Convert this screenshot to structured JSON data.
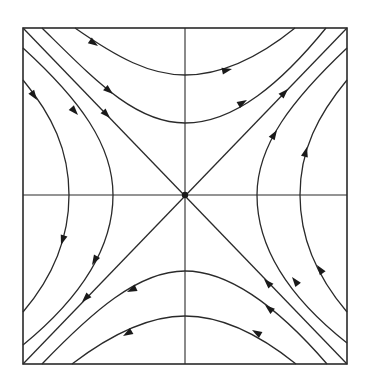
{
  "diagram": {
    "type": "phase-portrait",
    "kind": "saddle-point",
    "colors": {
      "ink": "#2a2a2a",
      "background": "#ffffff"
    },
    "frame": {
      "x0": 23,
      "y0": 28,
      "x1": 347,
      "y1": 364
    },
    "origin": {
      "x": 185,
      "y": 195
    },
    "separatrices": [
      {
        "name": "stable-diagonal",
        "from": [
          23,
          28
        ],
        "to": [
          347,
          364
        ],
        "flow": "inward"
      },
      {
        "name": "unstable-diagonal",
        "from": [
          347,
          28
        ],
        "to": [
          23,
          364
        ],
        "flow": "outward"
      }
    ],
    "trajectories": {
      "top": [
        {
          "left": [
            75,
            28
          ],
          "vertex": [
            185,
            75
          ],
          "right": [
            295,
            28
          ]
        },
        {
          "left": [
            42,
            28
          ],
          "vertex": [
            185,
            123
          ],
          "right": [
            326,
            28
          ]
        }
      ],
      "bottom": [
        {
          "left": [
            72,
            364
          ],
          "vertex": [
            185,
            316
          ],
          "right": [
            296,
            364
          ]
        },
        {
          "left": [
            42,
            364
          ],
          "vertex": [
            185,
            271
          ],
          "right": [
            327,
            364
          ]
        }
      ],
      "left": [
        {
          "top": [
            23,
            80
          ],
          "vertex": [
            69,
            195
          ],
          "bottom": [
            23,
            312
          ]
        },
        {
          "top": [
            23,
            48
          ],
          "vertex": [
            113,
            195
          ],
          "bottom": [
            23,
            345
          ]
        }
      ],
      "right": [
        {
          "top": [
            347,
            80
          ],
          "vertex": [
            300,
            195
          ],
          "bottom": [
            347,
            312
          ]
        },
        {
          "top": [
            347,
            48
          ],
          "vertex": [
            257,
            195
          ],
          "bottom": [
            347,
            343
          ]
        }
      ]
    }
  }
}
